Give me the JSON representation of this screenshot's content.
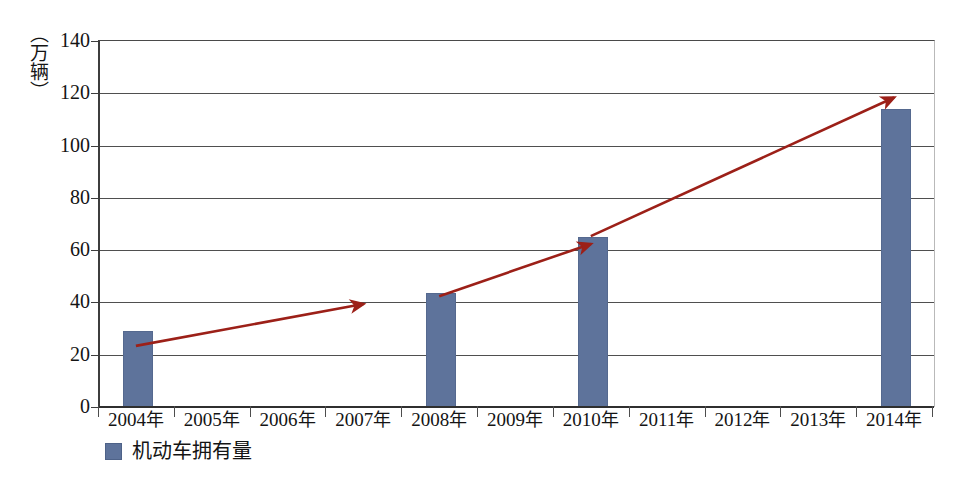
{
  "chart_data": {
    "type": "bar",
    "title": "",
    "xlabel": "",
    "ylabel": "（万辆）",
    "ylim": [
      0,
      140
    ],
    "yticks": [
      0,
      20,
      40,
      60,
      80,
      100,
      120,
      140
    ],
    "ytick_labels": [
      "0",
      "20",
      "40",
      "60",
      "80",
      "100",
      "120",
      "140"
    ],
    "grid": true,
    "legend_position": "bottom-left",
    "categories": [
      "2004年",
      "2005年",
      "2006年",
      "2007年",
      "2008年",
      "2009年",
      "2010年",
      "2011年",
      "2012年",
      "2013年",
      "2014年"
    ],
    "series": [
      {
        "name": "机动车拥有量",
        "color": "#5e739b",
        "values": [
          29,
          null,
          null,
          null,
          43.5,
          null,
          65,
          null,
          null,
          null,
          114
        ]
      }
    ],
    "annotations": [
      {
        "type": "arrow",
        "label": "trend-segment-1",
        "color": "#9c2018",
        "from": {
          "x": "2004年",
          "y": 23
        },
        "to": {
          "x": "2007年",
          "y": 39
        }
      },
      {
        "type": "arrow",
        "label": "trend-segment-2",
        "color": "#9c2018",
        "from": {
          "x": "2008年",
          "y": 42
        },
        "to": {
          "x": "2010年",
          "y": 62
        }
      },
      {
        "type": "arrow",
        "label": "trend-segment-3",
        "color": "#9c2018",
        "from": {
          "x": "2010年",
          "y": 65
        },
        "to": {
          "x": "2014年",
          "y": 118
        }
      }
    ]
  },
  "legend": {
    "items": [
      {
        "label": "机动车拥有量",
        "color": "#5e739b"
      }
    ]
  },
  "axis": {
    "y_unit_label": "（万辆）"
  }
}
